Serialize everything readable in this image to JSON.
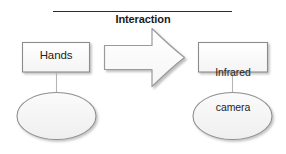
{
  "diagram": {
    "title_rule": {
      "name": "horizontal-rule",
      "color": "#2b2b2b"
    },
    "header": {
      "label": "Interaction"
    },
    "nodes": [
      {
        "id": "hands",
        "label": "Hands",
        "shape": "rectangle",
        "fill": "#fdfdfd",
        "stroke": "#8c8c8c"
      },
      {
        "id": "infrared-camera",
        "label_line1": "Infrared",
        "label_line2": "camera",
        "shape": "rectangle",
        "fill": "#fdfdfd",
        "stroke": "#8c8c8c"
      }
    ],
    "ellipses": [
      {
        "id": "hands-ellipse",
        "label": "",
        "fill": "#f7f7f7",
        "stroke": "#909090"
      },
      {
        "id": "camera-ellipse",
        "label": "",
        "fill": "#f7f7f7",
        "stroke": "#909090"
      }
    ],
    "arrow": {
      "id": "interaction-arrow",
      "direction": "right",
      "fill": "#fcfcfc",
      "stroke": "#9a9a9a"
    },
    "connectors": [
      {
        "id": "hands-connector",
        "color": "#b4b4b4"
      },
      {
        "id": "camera-connector",
        "color": "#b4b4b4"
      }
    ],
    "colors": {
      "background": "#ffffff",
      "text": "#1c1c1c",
      "shadow": "#c9c9c9"
    }
  }
}
